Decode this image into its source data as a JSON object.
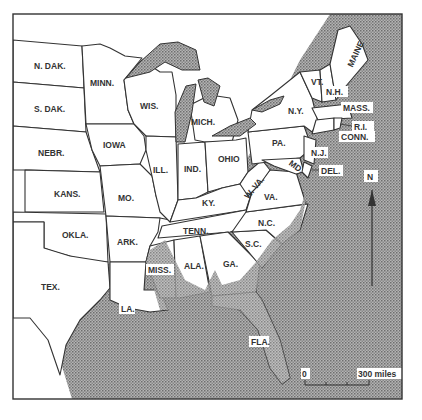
{
  "map": {
    "type": "thematic-region-map",
    "region": "Eastern and Central United States",
    "shading": {
      "pattern": "stippled",
      "color": "#9a9a9a",
      "meaning": "shaded area (coastal plain / lakes)"
    },
    "states": [
      {
        "id": "ndak",
        "label": "N. DAK."
      },
      {
        "id": "sdak",
        "label": "S. DAK."
      },
      {
        "id": "nebr",
        "label": "NEBR."
      },
      {
        "id": "kans",
        "label": "KANS."
      },
      {
        "id": "okla",
        "label": "OKLA."
      },
      {
        "id": "tex",
        "label": "TEX."
      },
      {
        "id": "minn",
        "label": "MINN."
      },
      {
        "id": "iowa",
        "label": "IOWA"
      },
      {
        "id": "mo",
        "label": "MO."
      },
      {
        "id": "ark",
        "label": "ARK."
      },
      {
        "id": "la",
        "label": "LA."
      },
      {
        "id": "wis",
        "label": "WIS."
      },
      {
        "id": "ill",
        "label": "ILL."
      },
      {
        "id": "miss",
        "label": "MISS."
      },
      {
        "id": "mich",
        "label": "MICH."
      },
      {
        "id": "ind",
        "label": "IND."
      },
      {
        "id": "ky",
        "label": "KY."
      },
      {
        "id": "tenn",
        "label": "TENN."
      },
      {
        "id": "ala",
        "label": "ALA."
      },
      {
        "id": "ohio",
        "label": "OHIO"
      },
      {
        "id": "wva",
        "label": "W. VA."
      },
      {
        "id": "va",
        "label": "VA."
      },
      {
        "id": "nc",
        "label": "N.C."
      },
      {
        "id": "sc",
        "label": "S.C."
      },
      {
        "id": "ga",
        "label": "GA."
      },
      {
        "id": "fla",
        "label": "FLA."
      },
      {
        "id": "pa",
        "label": "PA."
      },
      {
        "id": "ny",
        "label": "N.Y."
      },
      {
        "id": "nj",
        "label": "N.J."
      },
      {
        "id": "md",
        "label": "MD."
      },
      {
        "id": "del",
        "label": "DEL."
      },
      {
        "id": "vt",
        "label": "VT."
      },
      {
        "id": "nh",
        "label": "N.H."
      },
      {
        "id": "maine",
        "label": "MAINE"
      },
      {
        "id": "mass",
        "label": "MASS."
      },
      {
        "id": "ri",
        "label": "R.I."
      },
      {
        "id": "conn",
        "label": "CONN."
      }
    ],
    "north_arrow": {
      "label": "N"
    },
    "scale_bar": {
      "start_label": "0",
      "end_label": "300 miles"
    }
  }
}
